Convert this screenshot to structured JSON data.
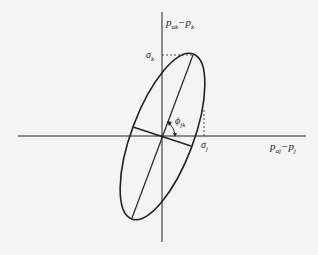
{
  "diagram": {
    "type": "error-ellipse",
    "y_axis_label": {
      "main": "p",
      "sub1": "ak",
      "op": "−",
      "main2": "p",
      "sub2": "k"
    },
    "x_axis_label": {
      "main": "p",
      "sub1": "aj",
      "op": "−",
      "main2": "p",
      "sub2": "j"
    },
    "sigma_k": {
      "main": "σ",
      "sub": "k"
    },
    "sigma_j": {
      "main": "σ",
      "sub": "j"
    },
    "angle_label": {
      "main": "ϕ",
      "sub": "jk"
    },
    "colors": {
      "stroke": "#222222",
      "background": "#f4f4f2"
    }
  }
}
